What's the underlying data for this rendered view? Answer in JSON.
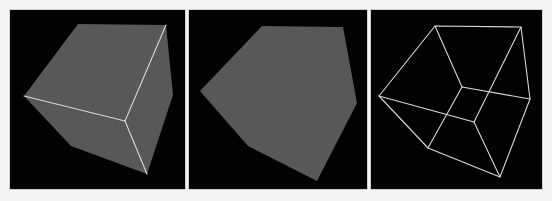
{
  "figure": {
    "panels": [
      {
        "id": "shaded-with-visible-edges",
        "mode": "solid-shaded-visible-edges",
        "face_color": "#585858",
        "edge_color": "#d8d8d8",
        "background": "#020202"
      },
      {
        "id": "silhouette",
        "mode": "flat-silhouette",
        "face_color": "#585858",
        "background": "#020202"
      },
      {
        "id": "wireframe",
        "mode": "wireframe-all-edges",
        "edge_color": "#d8d8d8",
        "background": "#020202"
      }
    ]
  }
}
